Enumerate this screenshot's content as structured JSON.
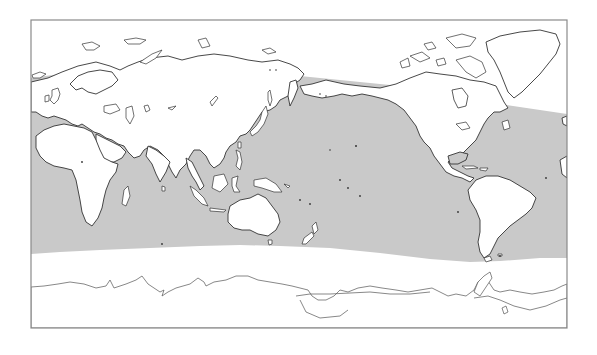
{
  "map": {
    "projection": "equirectangular, Pacific-centered",
    "frame": {
      "x": 31,
      "y": 20,
      "width": 536,
      "height": 308
    },
    "colors": {
      "background": "#ffffff",
      "shaded_region": "#c9c9c9",
      "land": "#ffffff",
      "coastline": "#333333",
      "frame": "#8a8a8a"
    },
    "shaded_region": {
      "description": "Ocean band shaded gray between roughly 60N and 50S",
      "north_edge": "~y 70 (Eurasia side) descending to ~y 100 at Atlantic right edge",
      "south_edge": "~y 245-262 curved"
    },
    "continents": [
      {
        "name": "Eurasia"
      },
      {
        "name": "Africa"
      },
      {
        "name": "Australia"
      },
      {
        "name": "North America"
      },
      {
        "name": "South America"
      },
      {
        "name": "Greenland"
      },
      {
        "name": "Antarctica"
      }
    ],
    "labels": []
  }
}
